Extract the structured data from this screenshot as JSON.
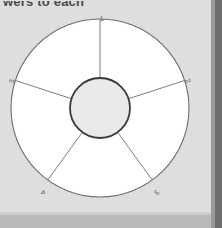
{
  "page": {
    "background_color": "#dedede",
    "scan_edge_color": "#6f6f6f",
    "bottom_band_color": "#b9b9b9"
  },
  "instruction": {
    "text": "wers to each"
  },
  "diagram": {
    "name": "five-segment-wheel",
    "type": "wheel",
    "segment_count": 5,
    "rim_fill": "#ffffff",
    "rim_stroke": "#6e6e6e",
    "hub_fill": "#e9e9e9",
    "hub_stroke": "#3a3a3a",
    "spoke_stroke": "#6e6e6e",
    "outer_radius": 90,
    "inner_radius": 30,
    "center": {
      "x": 100,
      "y": 100
    },
    "segments": [
      {
        "label": "1",
        "angle_deg": -90,
        "label_x": 102,
        "label_y": 13,
        "rotate": -6
      },
      {
        "label": "2",
        "angle_deg": -18,
        "label_x": 186,
        "label_y": 74,
        "rotate": 62
      },
      {
        "label": "3",
        "angle_deg": 54,
        "label_x": 155,
        "label_y": 183,
        "rotate": 130
      },
      {
        "label": "4",
        "angle_deg": 126,
        "label_x": 45,
        "label_y": 183,
        "rotate": -130
      },
      {
        "label": "5",
        "angle_deg": 198,
        "label_x": 14,
        "label_y": 74,
        "rotate": -62
      }
    ]
  }
}
